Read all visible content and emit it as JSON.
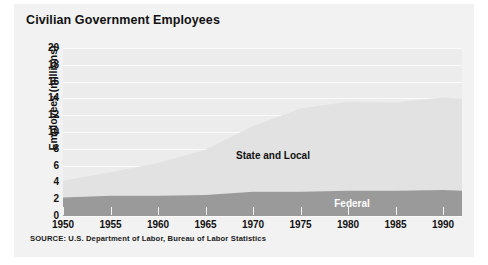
{
  "chart": {
    "title": "Civilian Government Employees",
    "source_note": "SOURCE: U.S. Department of Labor, Bureau of Labor Statistics",
    "y_axis_title": "Employees (millions)",
    "label_state_local": "State and Local",
    "label_federal": "Federal",
    "colors": {
      "card_background": "#f2f2f2",
      "plot_background": "#ececec",
      "gridline": "#fafafa",
      "state_and_local": "#e2e2e2",
      "federal": "#9a9a9a",
      "text": "#111111",
      "federal_label_text": "#ffffff"
    }
  },
  "chart_data": {
    "type": "area",
    "stacked": true,
    "title": "Civilian Government Employees",
    "subtitle": "",
    "xlabel": "",
    "ylabel": "Employees (millions)",
    "xlim": [
      1950,
      1992
    ],
    "ylim": [
      0,
      20
    ],
    "grid": true,
    "legend_position": "inline-annotation",
    "xticks": [
      1950,
      1955,
      1960,
      1965,
      1970,
      1975,
      1980,
      1985,
      1990
    ],
    "yticks": [
      0,
      2,
      4,
      6,
      8,
      10,
      12,
      14,
      16,
      18,
      20
    ],
    "x": [
      1950,
      1955,
      1960,
      1965,
      1970,
      1975,
      1980,
      1985,
      1990,
      1992
    ],
    "series": [
      {
        "name": "Federal",
        "color": "#9a9a9a",
        "values": [
          2.2,
          2.4,
          2.4,
          2.5,
          2.9,
          2.9,
          3.0,
          3.0,
          3.1,
          3.0
        ]
      },
      {
        "name": "State and Local",
        "color": "#e2e2e2",
        "values": [
          2.0,
          2.8,
          3.9,
          5.4,
          7.8,
          9.9,
          10.6,
          10.5,
          11.0,
          11.0
        ]
      }
    ],
    "totals": [
      4.2,
      5.2,
      6.3,
      7.9,
      10.7,
      12.8,
      13.6,
      13.5,
      14.1,
      14.0
    ],
    "annotations": [
      {
        "text": "State and Local",
        "x": 1972,
        "y": 7.0
      },
      {
        "text": "Federal",
        "x": 1981,
        "y": 1.6
      }
    ]
  }
}
